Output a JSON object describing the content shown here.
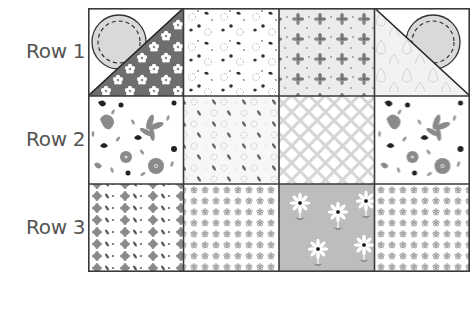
{
  "figure": {
    "type": "quilt-pattern-grid",
    "rows": 3,
    "columns": 4,
    "row_labels": [
      "Row 1",
      "Row 2",
      "Row 3"
    ]
  },
  "rows": [
    {
      "label": "Row 1",
      "tiles": [
        {
          "pattern": "circle-appliqué-over-dark-floral-triangle",
          "background": "#ffffff",
          "triangle_color": "#6e6e6e",
          "circle_color": "#d9d9d9",
          "diagonal": "bottom-left-to-top-right"
        },
        {
          "pattern": "scattered-small-flowers",
          "background": "#ffffff"
        },
        {
          "pattern": "four-petal-flowers",
          "background": "#ececec"
        },
        {
          "pattern": "circle-appliqué-over-raindrop-triangle",
          "background": "#ffffff",
          "triangle_color": "#f2f2f2",
          "circle_color": "#d9d9d9",
          "diagonal": "top-left-to-bottom-right"
        }
      ]
    },
    {
      "label": "Row 2",
      "tiles": [
        {
          "pattern": "large-floral-print",
          "background": "#ffffff"
        },
        {
          "pattern": "leaf-and-flower-diagonal",
          "background": "#f7f7f7"
        },
        {
          "pattern": "lattice",
          "background": "#ffffff",
          "line_color": "#cfcfcf"
        },
        {
          "pattern": "large-floral-print",
          "background": "#ffffff"
        }
      ]
    },
    {
      "label": "Row 3",
      "tiles": [
        {
          "pattern": "flower-and-leaf-rows",
          "background": "#ffffff"
        },
        {
          "pattern": "dense-tiny-flowers",
          "background": "#ffffff"
        },
        {
          "pattern": "daisies",
          "background": "#bdbdbd"
        },
        {
          "pattern": "dense-tiny-flowers",
          "background": "#ffffff"
        }
      ]
    }
  ],
  "colors": {
    "border": "#3a3a3a",
    "label_text": "#555555"
  }
}
